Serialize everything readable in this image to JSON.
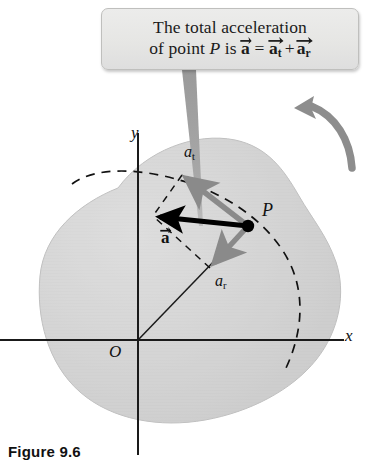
{
  "figure": {
    "caption": "Figure 9.6",
    "callout": {
      "line1": "The total acceleration",
      "line2_pre": "of point ",
      "line2_point": "P",
      "line2_is": " is ",
      "eq_a": "a",
      "eq_equals": "=",
      "eq_at": "a",
      "eq_at_sub": "t",
      "eq_plus": "+",
      "eq_ar": "a",
      "eq_ar_sub": "r"
    },
    "axes": {
      "y_label": "y",
      "x_label": "x",
      "origin_label": "O"
    },
    "points": {
      "p_label": "P"
    },
    "vectors": [
      {
        "name": "tangential-acceleration",
        "label": "a",
        "subscript": "t",
        "color": "#8a8a8a",
        "from": [
          248,
          226
        ],
        "to": [
          182,
          175
        ]
      },
      {
        "name": "radial-acceleration",
        "label": "a",
        "subscript": "r",
        "color": "#8a8a8a",
        "from": [
          248,
          226
        ],
        "to": [
          210,
          268
        ]
      },
      {
        "name": "total-acceleration",
        "label": "a",
        "subscript": "",
        "color": "#000000",
        "from": [
          248,
          226
        ],
        "to": [
          153,
          216
        ]
      }
    ],
    "colors": {
      "body_fill": "#d2d2d2",
      "body_edge": "#b9b9b9",
      "gray_vector": "#8a8a8a",
      "black_vector": "#000000",
      "axis": "#1a1a1a",
      "callout_fill": "#e9e9e7",
      "callout_border": "#bfbfbd",
      "rotation_arrow": "#8d8d8d"
    },
    "rotation": {
      "name": "rotation-direction-arrow",
      "sense": "counterclockwise"
    }
  }
}
